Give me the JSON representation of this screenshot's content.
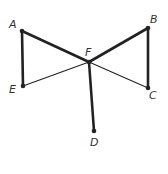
{
  "diagram": {
    "type": "geometry-figure",
    "points": [
      {
        "id": "A",
        "label": "A",
        "x": 22,
        "y": 31,
        "lx": 9,
        "ly": 28
      },
      {
        "id": "B",
        "label": "B",
        "x": 148,
        "y": 28,
        "lx": 150,
        "ly": 23
      },
      {
        "id": "C",
        "label": "C",
        "x": 148,
        "y": 88,
        "lx": 149,
        "ly": 99
      },
      {
        "id": "D",
        "label": "D",
        "x": 94,
        "y": 131,
        "lx": 90,
        "ly": 146
      },
      {
        "id": "E",
        "label": "E",
        "x": 23,
        "y": 86,
        "lx": 9,
        "ly": 93
      },
      {
        "id": "F",
        "label": "F",
        "x": 89,
        "y": 62,
        "lx": 85,
        "ly": 56
      }
    ],
    "segments": [
      {
        "from": "A",
        "to": "F",
        "weight": "thick"
      },
      {
        "from": "F",
        "to": "B",
        "weight": "thick"
      },
      {
        "from": "A",
        "to": "E",
        "weight": "thick"
      },
      {
        "from": "B",
        "to": "C",
        "weight": "thick"
      },
      {
        "from": "F",
        "to": "D",
        "weight": "thick"
      },
      {
        "from": "E",
        "to": "F",
        "weight": "thin"
      },
      {
        "from": "F",
        "to": "C",
        "weight": "thin"
      }
    ],
    "colors": {
      "line": "#222222",
      "label": "#333333",
      "background": "#ffffff"
    }
  }
}
